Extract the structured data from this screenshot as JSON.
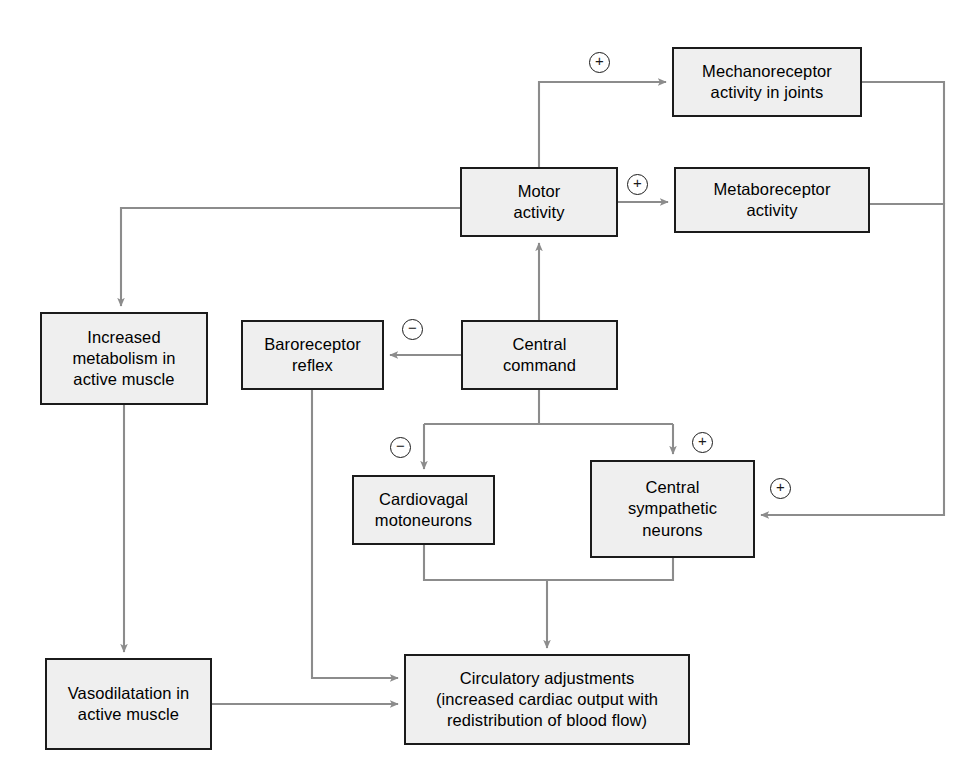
{
  "diagram": {
    "colors": {
      "box_fill": "#efefef",
      "box_border": "#1b1b1b",
      "connector": "#8c8c8c",
      "text": "#000000",
      "page_background": "#ffffff"
    },
    "nodes": [
      {
        "id": "mechanoreceptor",
        "label": "Mechanoreceptor\nactivity in joints",
        "x": 672,
        "y": 47,
        "w": 190,
        "h": 70
      },
      {
        "id": "metaboreceptor",
        "label": "Metaboreceptor\nactivity",
        "x": 674,
        "y": 167,
        "w": 196,
        "h": 66
      },
      {
        "id": "motor_activity",
        "label": "Motor\nactivity",
        "x": 460,
        "y": 167,
        "w": 158,
        "h": 70
      },
      {
        "id": "increased_metabolism",
        "label": "Increased\nmetabolism in\nactive muscle",
        "x": 40,
        "y": 312,
        "w": 168,
        "h": 93
      },
      {
        "id": "baroreceptor_reflex",
        "label": "Baroreceptor\nreflex",
        "x": 241,
        "y": 320,
        "w": 143,
        "h": 70
      },
      {
        "id": "central_command",
        "label": "Central\ncommand",
        "x": 461,
        "y": 320,
        "w": 157,
        "h": 70
      },
      {
        "id": "cardiovagal_motoneurons",
        "label": "Cardiovagal\nmotoneurons",
        "x": 352,
        "y": 475,
        "w": 143,
        "h": 70
      },
      {
        "id": "central_sympathetic_neurons",
        "label": "Central\nsympathetic\nneurons",
        "x": 590,
        "y": 460,
        "w": 165,
        "h": 98
      },
      {
        "id": "vasodilatation",
        "label": "Vasodilatation in\nactive muscle",
        "x": 45,
        "y": 658,
        "w": 167,
        "h": 92
      },
      {
        "id": "circulatory_adjustments",
        "label": "Circulatory adjustments\n(increased cardiac output with\nredistribution of blood flow)",
        "x": 404,
        "y": 654,
        "w": 286,
        "h": 91
      }
    ],
    "signs": [
      {
        "id": "sign-motor-to-mechanoreceptor",
        "symbol": "+",
        "x": 589,
        "y": 52
      },
      {
        "id": "sign-motor-to-metaboreceptor",
        "symbol": "+",
        "x": 627,
        "y": 174
      },
      {
        "id": "sign-central-command-to-baroreceptor",
        "symbol": "−",
        "x": 402,
        "y": 319
      },
      {
        "id": "sign-central-command-to-cardiovagal",
        "symbol": "−",
        "x": 390,
        "y": 437
      },
      {
        "id": "sign-central-command-to-sympathetic",
        "symbol": "+",
        "x": 692,
        "y": 432
      },
      {
        "id": "sign-receptors-to-sympathetic",
        "symbol": "+",
        "x": 770,
        "y": 478
      }
    ],
    "edges": [
      {
        "id": "edge-motor-to-mechanoreceptor",
        "from": "motor_activity",
        "to": "mechanoreceptor",
        "sign": "+"
      },
      {
        "id": "edge-motor-to-metaboreceptor",
        "from": "motor_activity",
        "to": "metaboreceptor",
        "sign": "+"
      },
      {
        "id": "edge-motor-to-increased-metabolism",
        "from": "motor_activity",
        "to": "increased_metabolism",
        "sign": ""
      },
      {
        "id": "edge-central-command-to-motor",
        "from": "central_command",
        "to": "motor_activity",
        "sign": ""
      },
      {
        "id": "edge-central-command-to-baroreceptor",
        "from": "central_command",
        "to": "baroreceptor_reflex",
        "sign": "−"
      },
      {
        "id": "edge-central-command-to-cardiovagal",
        "from": "central_command",
        "to": "cardiovagal_motoneurons",
        "sign": "−"
      },
      {
        "id": "edge-central-command-to-sympathetic",
        "from": "central_command",
        "to": "central_sympathetic_neurons",
        "sign": "+"
      },
      {
        "id": "edge-receptors-to-sympathetic",
        "from": "mechanoreceptor,metaboreceptor",
        "to": "central_sympathetic_neurons",
        "sign": "+"
      },
      {
        "id": "edge-increased-metabolism-to-vasodilatation",
        "from": "increased_metabolism",
        "to": "vasodilatation",
        "sign": ""
      },
      {
        "id": "edge-baroreceptor-to-circulatory",
        "from": "baroreceptor_reflex",
        "to": "circulatory_adjustments",
        "sign": ""
      },
      {
        "id": "edge-vasodilatation-to-circulatory",
        "from": "vasodilatation",
        "to": "circulatory_adjustments",
        "sign": ""
      },
      {
        "id": "edge-neurons-to-circulatory",
        "from": "cardiovagal_motoneurons,central_sympathetic_neurons",
        "to": "circulatory_adjustments",
        "sign": ""
      }
    ]
  }
}
